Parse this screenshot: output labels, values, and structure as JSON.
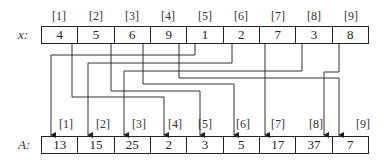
{
  "x_array": {
    "label": "x:",
    "indices": [
      "[1]",
      "[2]",
      "[3]",
      "[4]",
      "[5]",
      "[6]",
      "[7]",
      "[8]",
      "[9]"
    ],
    "values": [
      "4",
      "5",
      "6",
      "9",
      "1",
      "2",
      "7",
      "3",
      "8"
    ]
  },
  "a_array": {
    "label": "A:",
    "indices": [
      "[1]",
      "[2]",
      "[3]",
      "[4]",
      "[5]",
      "[6]",
      "[7]",
      "[8]",
      "[9]"
    ],
    "values": [
      "13",
      "15",
      "25",
      "2",
      "3",
      "5",
      "17",
      "37",
      "7"
    ]
  },
  "mappings": [
    {
      "from": 1,
      "to": 4
    },
    {
      "from": 2,
      "to": 5
    },
    {
      "from": 3,
      "to": 6
    },
    {
      "from": 4,
      "to": 9
    },
    {
      "from": 5,
      "to": 1
    },
    {
      "from": 6,
      "to": 2
    },
    {
      "from": 7,
      "to": 7
    },
    {
      "from": 8,
      "to": 3
    },
    {
      "from": 9,
      "to": 8
    }
  ]
}
